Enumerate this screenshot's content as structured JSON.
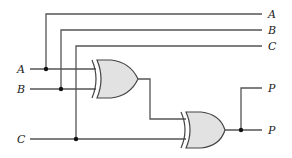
{
  "diagram": {
    "type": "logic-circuit",
    "inputs": [
      {
        "label": "A"
      },
      {
        "label": "B"
      },
      {
        "label": "C"
      }
    ],
    "bus_outputs": [
      {
        "label": "A"
      },
      {
        "label": "B"
      },
      {
        "label": "C"
      }
    ],
    "outputs": [
      {
        "label": "P"
      },
      {
        "label": "P"
      }
    ],
    "gates": [
      {
        "id": "g1",
        "type": "XOR",
        "inputs": [
          "A",
          "B"
        ]
      },
      {
        "id": "g2",
        "type": "XOR",
        "inputs": [
          "g1",
          "C"
        ],
        "output": "P"
      }
    ],
    "colors": {
      "wire": "#555555",
      "gate_fill": "#e2e2e2",
      "gate_stroke": "#444444",
      "junction": "#111111"
    }
  }
}
